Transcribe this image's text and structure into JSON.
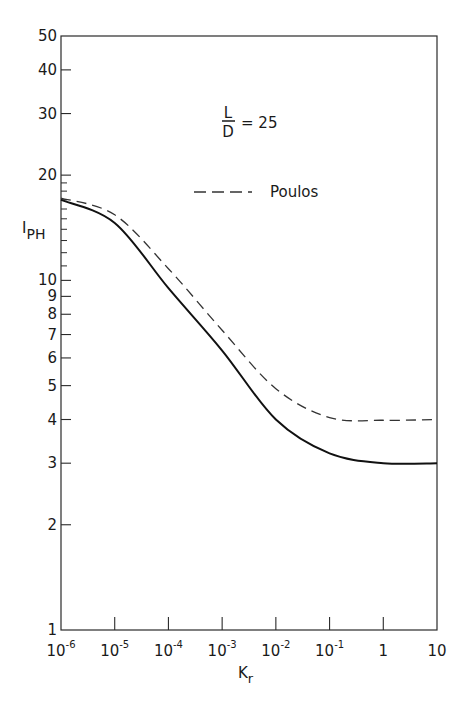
{
  "chart_data": {
    "type": "line",
    "title": "",
    "annotation": {
      "fraction_num": "L",
      "fraction_den": "D",
      "equals": "= 25"
    },
    "xlabel": "K",
    "xlabel_sub": "r",
    "ylabel": "I",
    "ylabel_sub": "PH",
    "xscale": "log",
    "yscale": "log",
    "xlim": [
      1e-06,
      10
    ],
    "ylim": [
      1,
      50
    ],
    "x_ticks": [
      {
        "value": 1e-06,
        "base": "10",
        "exp": "-6"
      },
      {
        "value": 1e-05,
        "base": "10",
        "exp": "-5"
      },
      {
        "value": 0.0001,
        "base": "10",
        "exp": "-4"
      },
      {
        "value": 0.001,
        "base": "10",
        "exp": "-3"
      },
      {
        "value": 0.01,
        "base": "10",
        "exp": "-2"
      },
      {
        "value": 0.1,
        "base": "10",
        "exp": "-1"
      },
      {
        "value": 1,
        "base": "1",
        "exp": ""
      },
      {
        "value": 10,
        "base": "10",
        "exp": ""
      }
    ],
    "y_ticks": [
      {
        "value": 1,
        "label": "1"
      },
      {
        "value": 2,
        "label": "2"
      },
      {
        "value": 3,
        "label": "3"
      },
      {
        "value": 4,
        "label": "4"
      },
      {
        "value": 5,
        "label": "5"
      },
      {
        "value": 6,
        "label": "6"
      },
      {
        "value": 7,
        "label": "7"
      },
      {
        "value": 8,
        "label": "8"
      },
      {
        "value": 9,
        "label": "9"
      },
      {
        "value": 10,
        "label": "10"
      },
      {
        "value": 20,
        "label": "20"
      },
      {
        "value": 30,
        "label": "30"
      },
      {
        "value": 40,
        "label": "40"
      },
      {
        "value": 50,
        "label": "50"
      }
    ],
    "y_minor_ticks": [
      11,
      12,
      13,
      14,
      15,
      16,
      17,
      18,
      19
    ],
    "grid": false,
    "legend": {
      "position": "upper right",
      "entries": [
        {
          "label": "Poulos",
          "style": "dashed"
        }
      ]
    },
    "series": [
      {
        "name": "Present solution",
        "style": "solid",
        "x": [
          1e-06,
          1e-05,
          0.0001,
          0.001,
          0.01,
          0.1,
          1,
          10
        ],
        "values": [
          17.0,
          14.6,
          9.5,
          6.3,
          4.0,
          3.2,
          3.0,
          3.0
        ]
      },
      {
        "name": "Poulos",
        "style": "dashed",
        "x": [
          1e-06,
          1e-05,
          0.0001,
          0.001,
          0.01,
          0.1,
          1,
          10
        ],
        "values": [
          17.2,
          15.4,
          10.8,
          7.2,
          4.9,
          4.05,
          3.98,
          4.0
        ]
      }
    ]
  }
}
